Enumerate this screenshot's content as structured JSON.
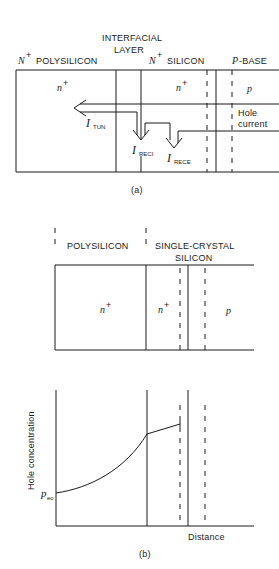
{
  "figure_a": {
    "caption": "(a)",
    "region_labels": {
      "interfacial_line1": "INTERFACIAL",
      "interfacial_line2": "LAYER",
      "n_plus_prefix": "N",
      "polysilicon": "POLYSILICON",
      "silicon": "SILICON",
      "p_prefix": "P",
      "base": "-BASE",
      "plus": "+"
    },
    "doping_labels": {
      "poly": "n",
      "silicon": "n",
      "base": "p",
      "plus": "+"
    },
    "hole_current_line1": "Hole",
    "hole_current_line2": "current",
    "currents": {
      "symbol": "I",
      "tun": "TUN",
      "reci": "RECI",
      "rece": "RECE"
    }
  },
  "figure_b": {
    "caption": "(b)",
    "region_labels": {
      "polysilicon": "POLYSILICON",
      "single_crystal_line1": "SINGLE-CRYSTAL",
      "single_crystal_line2": "SILICON"
    },
    "doping_labels": {
      "poly": "n",
      "silicon": "n",
      "base": "p",
      "plus": "+"
    },
    "plot": {
      "ylabel": "Hole concentration",
      "xlabel": "Distance",
      "y0_label_main": "p",
      "y0_label_sub": "eo"
    }
  }
}
